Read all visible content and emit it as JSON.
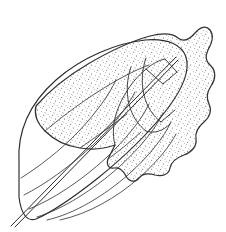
{
  "figure": {
    "style": "ink line drawing with stipple shading",
    "caption": "",
    "width_px": 226,
    "height_px": 232,
    "background_color": "#ffffff",
    "ink_color": "#2b2b2b",
    "stipple_color": "#4a4a4a",
    "line_color": "#3a3a3a"
  },
  "parts": {
    "leaf_blade": {
      "name": "leaf-blade",
      "label": "leaf blade"
    },
    "midrib": {
      "name": "midrib",
      "label": "midrib and petiole"
    },
    "veins": {
      "name": "lateral-veins",
      "label": "lateral veins",
      "count": 6
    },
    "mine": {
      "name": "blotch-mine",
      "label": "stippled blotch mine"
    },
    "fold": {
      "name": "folded-flap",
      "label": "folded leaf flap"
    }
  },
  "geometry": {
    "leaf_outline": "M 19 163 C 17 131 30 103 56 80 C 82 57 117 43 145 40 C 168 38 182 45 186 57 C 190 70 183 88 168 108 C 150 132 124 157 98 178 C 74 197 50 213 36 219 C 27 222 21 214 19 197 Z",
    "midrib": "M 11 226 L 176 57",
    "midrib_second": "M 15 227 L 178 60",
    "veins": [
      "M 21 178 C 37 168 60 151 79 131 C 96 113 109 95 116 80",
      "M 24 195 C 44 185 71 166 94 144 C 114 125 128 106 135 92",
      "M 29 209 C 52 200 81 181 106 158 C 127 138 142 119 149 104",
      "M 37 217 C 63 209 93 190 119 167 C 141 147 156 128 163 113",
      "M 47 220 C 74 214 104 196 129 174 C 150 155 164 137 171 122",
      "M 60 220 C 88 214 116 198 139 178 C 158 161 170 146 176 134"
    ],
    "mine_outline": "M 36 106 C 48 92 66 77 88 64 C 110 51 132 41 150 36 C 162 33 172 33 178 38 C 183 42 189 40 195 33 C 200 27 206 25 210 30 C 214 35 212 43 208 50 C 205 56 206 62 211 66 C 216 71 216 79 211 86 C 207 92 206 98 209 104 C 212 110 210 117 204 122 C 198 127 195 133 196 139 C 197 146 192 152 184 155 C 176 158 171 162 170 168 C 169 174 163 177 155 175 C 148 173 142 174 139 178 C 135 183 129 182 126 176 C 123 170 119 167 114 168 C 109 169 106 165 108 159 L 115 145 C 104 149 92 150 80 148 C 66 146 54 140 45 131 C 37 123 34 114 36 106 Z",
    "fold_outer": "M 115 145 C 112 134 113 120 119 106 C 125 92 134 79 145 70 C 152 64 159 60 165 59",
    "fold_lines": [
      "M 131 67 C 127 78 126 92 129 104 C 132 116 138 125 146 131",
      "M 146 58 C 142 69 141 83 144 95 C 147 107 153 116 161 122",
      "M 165 59 L 177 72",
      "M 177 72 L 163 84",
      "M 163 84 L 146 69",
      "M 161 122 L 175 110",
      "M 146 131 C 154 134 163 131 170 124"
    ],
    "inner_contours": [
      "M 45 131 C 58 120 76 106 96 93 C 116 80 135 70 149 65",
      "M 80 148 C 93 139 110 127 127 114",
      "M 108 159 C 118 152 130 142 141 132"
    ],
    "stipple_region": "M 36 106 C 48 92 66 77 88 64 C 110 51 132 41 150 36 C 162 33 172 33 178 38 C 183 42 189 40 195 33 C 200 27 206 25 210 30 C 214 35 212 43 208 50 C 205 56 206 62 211 66 C 216 71 216 79 211 86 C 207 92 206 98 209 104 C 212 110 210 117 204 122 C 198 127 195 133 196 139 C 197 146 192 152 184 155 C 176 158 171 162 170 168 C 169 174 163 177 155 175 C 148 173 142 174 139 178 C 135 183 129 182 126 176 C 123 170 119 167 114 168 C 109 169 106 165 108 159 L 115 145 C 104 149 92 150 80 148 C 66 146 54 140 45 131 C 37 123 34 114 36 106 Z"
  }
}
